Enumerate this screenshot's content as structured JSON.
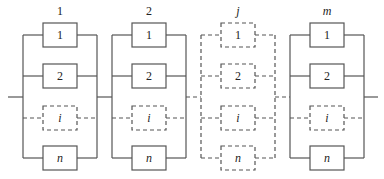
{
  "diagram": {
    "type": "series-parallel reliability block diagram",
    "line_color": "#555555",
    "subsystems": [
      {
        "label": "1",
        "italic": false,
        "dashed": false,
        "components": [
          {
            "label": "1",
            "italic": false,
            "dashed": false
          },
          {
            "label": "2",
            "italic": false,
            "dashed": false
          },
          {
            "label": "i",
            "italic": true,
            "dashed": true
          },
          {
            "label": "n",
            "italic": true,
            "dashed": false
          }
        ]
      },
      {
        "label": "2",
        "italic": false,
        "dashed": false,
        "components": [
          {
            "label": "1",
            "italic": false,
            "dashed": false
          },
          {
            "label": "2",
            "italic": false,
            "dashed": false
          },
          {
            "label": "i",
            "italic": true,
            "dashed": true
          },
          {
            "label": "n",
            "italic": true,
            "dashed": false
          }
        ]
      },
      {
        "label": "j",
        "italic": true,
        "dashed": true,
        "components": [
          {
            "label": "1",
            "italic": false,
            "dashed": true
          },
          {
            "label": "2",
            "italic": false,
            "dashed": true
          },
          {
            "label": "i",
            "italic": true,
            "dashed": true
          },
          {
            "label": "n",
            "italic": true,
            "dashed": true
          }
        ]
      },
      {
        "label": "m",
        "italic": true,
        "dashed": false,
        "components": [
          {
            "label": "1",
            "italic": false,
            "dashed": false
          },
          {
            "label": "2",
            "italic": false,
            "dashed": false
          },
          {
            "label": "i",
            "italic": true,
            "dashed": true
          },
          {
            "label": "n",
            "italic": true,
            "dashed": false
          }
        ]
      }
    ]
  }
}
